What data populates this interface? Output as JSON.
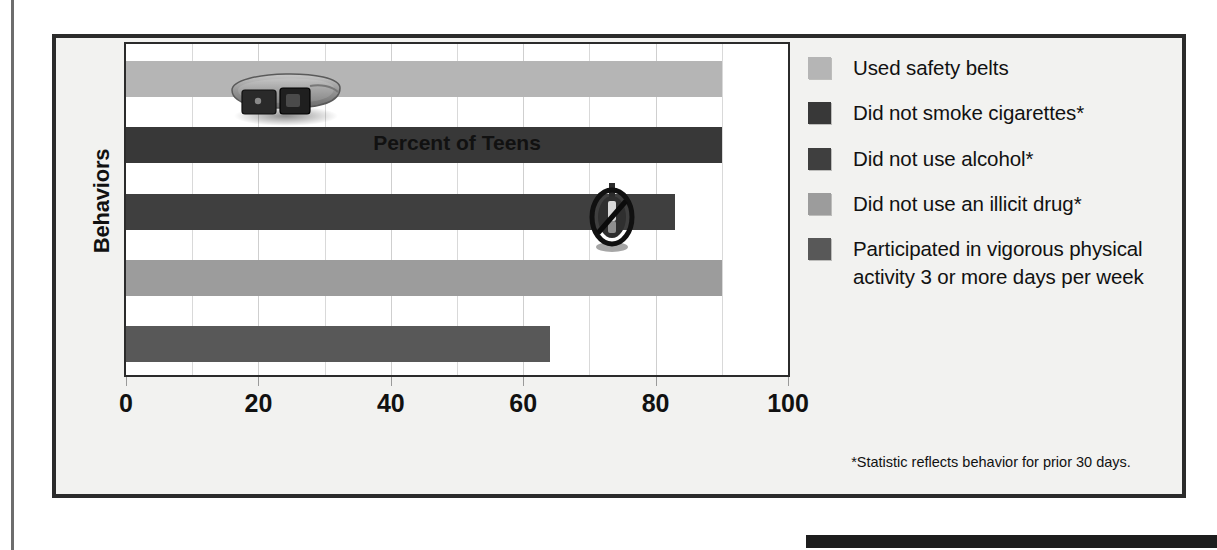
{
  "chart_data": {
    "type": "bar",
    "orientation": "horizontal",
    "title": "",
    "xlabel": "Percent of Teens",
    "ylabel": "Behaviors",
    "xlim": [
      0,
      100
    ],
    "xticks": [
      0,
      20,
      40,
      60,
      80,
      100
    ],
    "xtick_labels": [
      "0",
      "20",
      "40",
      "60",
      "80",
      "100"
    ],
    "grid": true,
    "grid_axis": "x",
    "grid_step": 10,
    "legend_position": "right",
    "categories": [
      "Used safety belts",
      "Did not smoke cigarettes*",
      "Did not use alcohol*",
      "Did not use an illicit drug*",
      "Participated in vigorous physical activity 3 or more days per week"
    ],
    "values": [
      90,
      90,
      83,
      90,
      64
    ],
    "colors": [
      "#b5b5b5",
      "#383838",
      "#3f3f3f",
      "#9c9c9c",
      "#585858"
    ],
    "footnote": "*Statistic reflects behavior for prior 30 days.",
    "annotations": [
      "seatbelt-photo",
      "no-smoking-sign-photo"
    ]
  },
  "axes": {
    "y_title": "Behaviors",
    "x_title": "Percent of Teens",
    "x_ticks": [
      "0",
      "20",
      "40",
      "60",
      "80",
      "100"
    ]
  },
  "legend": {
    "items": [
      {
        "label": "Used safety belts",
        "color": "#b5b5b5"
      },
      {
        "label": "Did not smoke cigarettes*",
        "color": "#383838"
      },
      {
        "label": "Did not use alcohol*",
        "color": "#3f3f3f"
      },
      {
        "label": "Did not use an illicit drug*",
        "color": "#9c9c9c"
      },
      {
        "label": "Participated in vigorous physical activity 3 or more days per week",
        "color": "#585858"
      }
    ]
  },
  "footnote": {
    "text": "*Statistic reflects behavior for prior 30 days."
  }
}
